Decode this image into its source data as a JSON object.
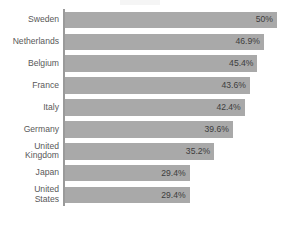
{
  "chart_data": {
    "type": "bar",
    "orientation": "horizontal",
    "title": "",
    "subtitle": "",
    "xlabel": "",
    "ylabel": "",
    "grid": false,
    "legend": null,
    "legend_position": "none",
    "value_suffix": "%",
    "xlim": [
      0,
      50
    ],
    "axis_line": true,
    "categories": [
      "Sweden",
      "Netherlands",
      "Belgium",
      "France",
      "Italy",
      "Germany",
      "United Kingdom",
      "Japan",
      "United States"
    ],
    "values": [
      50,
      46.9,
      45.4,
      43.6,
      42.4,
      39.6,
      35.2,
      29.4,
      29.4
    ],
    "value_labels": [
      "50%",
      "46.9%",
      "45.4%",
      "43.6%",
      "42.4%",
      "39.6%",
      "35.2%",
      "29.4%",
      "29.4%"
    ],
    "category_label_lines": [
      [
        "Sweden"
      ],
      [
        "Netherlands"
      ],
      [
        "Belgium"
      ],
      [
        "France"
      ],
      [
        "Italy"
      ],
      [
        "Germany"
      ],
      [
        "United",
        "Kingdom"
      ],
      [
        "Japan"
      ],
      [
        "United",
        "States"
      ]
    ]
  },
  "colors": {
    "bar_fill": "#a9a9a9",
    "background": "#ffffff",
    "axis_line": "#9a9a9a",
    "category_label": "#595959",
    "value_label": "#3d3d3d"
  }
}
